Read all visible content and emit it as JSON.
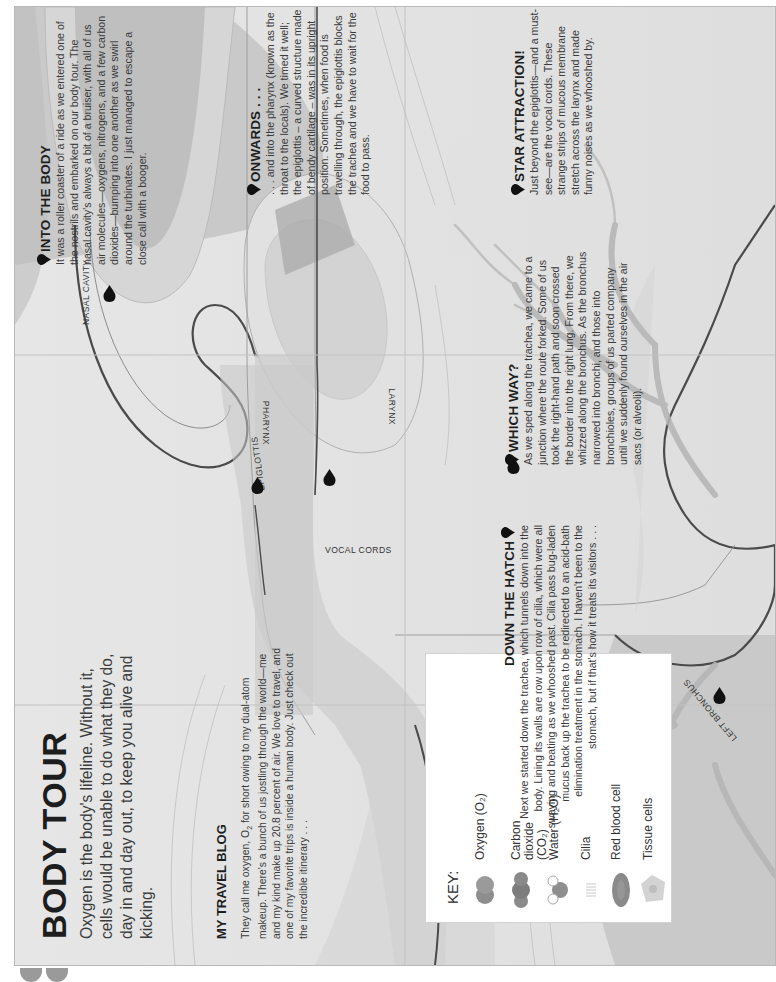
{
  "page": {
    "title": "BODY TOUR",
    "lead": "Oxygen is the body's lifeline. Without it, cells would be unable to do what they do, day in and day out, to keep you alive and kicking."
  },
  "blog": {
    "heading": "MY TRAVEL BLOG",
    "body_before_sub": "They call me oxygen, O",
    "sub": "2",
    "body_after_sub": " for short owing to my dual-atom makeup. There's a bunch of us jostling through the world—me and my kind make up 20.8 percent of air. We love to travel, and one of my favorite trips is inside a human body. Just check out the incredible itinerary . . ."
  },
  "key": {
    "title": "KEY:",
    "items": [
      {
        "label": "Oxygen (O₂)",
        "icon": "oxygen-molecule-icon"
      },
      {
        "label": "Carbon dioxide (CO₂)",
        "icon": "carbon-dioxide-molecule-icon"
      },
      {
        "label": "Water (H₂O)",
        "icon": "water-molecule-icon"
      },
      {
        "label": "Cilia",
        "icon": "cilia-icon"
      },
      {
        "label": "Red blood cell",
        "icon": "red-blood-cell-icon"
      },
      {
        "label": "Tissue cells",
        "icon": "tissue-cells-icon"
      }
    ]
  },
  "stops": [
    {
      "number": "1",
      "heading": "INTO THE BODY",
      "body": "It was a roller coaster of a ride as we entered one of the nostrils and embarked on our body tour. The nasal cavity's always a bit of a bruiser, with all of us air molecules—oxygens, nitrogens, and a few carbon dioxides—bumping into one another as we swirl around the turbinates. I just managed to escape a close call with a booger."
    },
    {
      "number": "2",
      "heading": "ONWARDS . . .",
      "body": ". . . and into the pharynx (known as the throat to the locals). We timed it well; the epiglottis – a curved structure made of bendy cartilage – was in its upright position. Sometimes, when food is travelling through, the epiglottis blocks the trachea and we have to wait for the food to pass."
    },
    {
      "number": "3",
      "heading": "STAR ATTRACTION!",
      "body": "Just beyond the epiglottis—and a must-see—are the vocal cords. These strange strips of mucous membrane stretch across the larynx and made funny noises as we whooshed by."
    },
    {
      "number": "4",
      "heading": "DOWN THE HATCH",
      "body": "Next we started down the trachea, which tunnels down into the body. Lining its walls are row upon row of cilia, which were all swaying and beating as we whooshed past. Cilia pass bug-laden mucus back up the trachea to be redirected to an acid-bath elimination treatment in the stomach. I haven't been to the stomach, but if that's how it treats its visitors . . ."
    },
    {
      "number": "5",
      "heading": "WHICH WAY?",
      "body": "As we sped along the trachea, we came to a junction where the route forked. Some of us took the right-hand path and soon crossed the border into the right lung. From there, we whizzed along the bronchus. As the bronchus narrowed into bronchi, and those into bronchioles, groups of us parted company until we suddenly found ourselves in the air sacs (or alveoli)."
    }
  ],
  "map_labels": {
    "nasal_cavity": "NASAL CAVITY",
    "pharynx": "PHARYNX",
    "epiglottis": "EPIGLOTTIS",
    "vocal_cords": "VOCAL CORDS",
    "larynx": "LARYNX",
    "left_bronchus": "LEFT BRONCHUS",
    "right_bronchus": "RIGHT BRONCHUS"
  },
  "map_pins": [
    "1",
    "2",
    "3",
    "4",
    "4",
    "5",
    "5"
  ],
  "colors": {
    "paper": "#e9e9e9",
    "tissue_dark": "#9a9a9a",
    "tissue_mid": "#bdbdbd",
    "airway": "#cfcfcf",
    "outline": "#4a4a4a",
    "pin": "#111111",
    "text": "#2a2a2a"
  }
}
